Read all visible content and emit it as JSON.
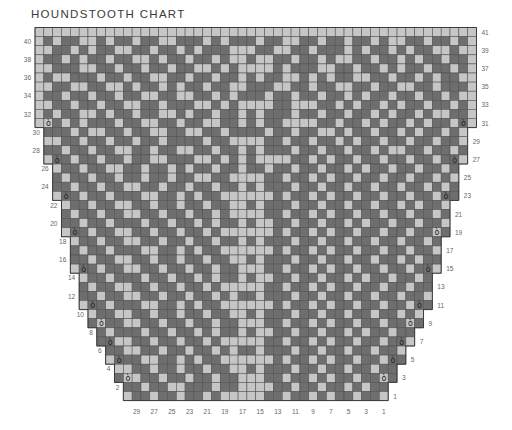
{
  "title": "HOUNDSTOOTH CHART",
  "chart_data": {
    "type": "heatmap",
    "title": "HOUNDSTOOTH CHART",
    "columns": 50,
    "rows": 41,
    "colors": {
      "light": "#c6c6c6",
      "dark": "#6e6e6e",
      "grid": "#4f4f4f",
      "marker": "#222222"
    },
    "marker_symbol": "ò",
    "marker_rows": [
      3,
      5,
      7,
      9,
      11,
      15,
      19,
      23,
      27,
      31
    ],
    "row_offsets": {
      "1": 10,
      "2": 10,
      "3": 9,
      "4": 9,
      "5": 8,
      "6": 8,
      "7": 7,
      "8": 7,
      "9": 6,
      "10": 6,
      "11": 5,
      "12": 5,
      "13": 5,
      "14": 5,
      "15": 4,
      "16": 4,
      "17": 4,
      "18": 4,
      "19": 3,
      "20": 3,
      "21": 3,
      "22": 3,
      "23": 2,
      "24": 2,
      "25": 2,
      "26": 2,
      "27": 1,
      "28": 1,
      "29": 1,
      "30": 1,
      "31": 0,
      "32": 0,
      "33": 0,
      "34": 0,
      "35": 0,
      "36": 0,
      "37": 0,
      "38": 0,
      "39": 0,
      "40": 0,
      "41": 0
    },
    "left_row_labels": [
      "40",
      "38",
      "36",
      "34",
      "32",
      "30",
      "28",
      "26",
      "24",
      "22",
      "20",
      "18",
      "16",
      "14",
      "12",
      "10",
      "8",
      "6",
      "4",
      "2"
    ],
    "right_row_labels": [
      "41",
      "39",
      "37",
      "35",
      "33",
      "31",
      "29",
      "27",
      "25",
      "23",
      "21",
      "19",
      "17",
      "15",
      "13",
      "11",
      "9",
      "7",
      "5",
      "3",
      "1"
    ],
    "bottom_col_labels": [
      "29",
      "27",
      "25",
      "23",
      "21",
      "19",
      "17",
      "15",
      "13",
      "11",
      "9",
      "7",
      "5",
      "3",
      "1"
    ],
    "grid_rows_top_to_bottom": [
      "00000000000000000000000000000000000000000000000000",
      "01011001011011001110101110110011011011010011011010",
      "00110101100110110101110001100110111010110101100100",
      "01101011011001011011010010011011010011011010110110",
      "00111001101101101100101000010111001101101011011010",
      "01001110110110011011011010110010101100110110101100",
      "00110011001011010110110011100110110011011001101110",
      "01101101101100110011010111011011011010110110110100",
      "00110110110011011100101000011000110101101011011010",
      "01011001011011001011011010111011011011010110100110",
      "00101011101100110110011010110000110110101101011010",
      "01110100110110011001101111011011001011011010110100",
      "00011011011011011110110000110110110101101101101100",
      "01101101100110110011011010111011011011010011011010",
      "00110110110110011100101010000110101101101101101100",
      "01011011001101101011011011011011011010110110110100",
      "00101101101101101100110000110110101101101101101010",
      "01110110110011011011011010111011011011011011010110",
      "00011011011100110101100000010110101101101101101100",
      "01101101100110110110110010111011011011011010110100",
      "00110110110011011011010000110110101101101101101100",
      "01011011011101101101011010011011011010110110110010",
      "00101101100110110110100000010110101101101101101100",
      "01110110110011011011011010111011011011011011010110",
      "00011011011100110101100000010110101101101101101100",
      "01101101100110110110110010111011011011011010110100",
      "00110110110011011011011000110110101101101101101100",
      "01011011011101101101011010011011011010110110110010",
      "00101101100110110110100000110110101101101101101100",
      "01110110110011011011010110111011011011011011010110",
      "00011011011100110101100000010110101101101101101100",
      "01101101100110110110110010111011011011011010110100",
      "00110110110011011011011000110110101101101101101100",
      "01011011011101101101011010011011011010110110110010",
      "00101101100110110110100000110110101101101101101100",
      "01110110110011011011010110111011011011011011010110",
      "00011011011100110101100000010110101101101101101100",
      "01101101100110110110110010111011011011011010110100",
      "00110110110011011011011000110110101101101101101100",
      "00011011011101100111011000011011011010110110110000",
      "00010010110110110110100000110110101101101011000000"
    ]
  }
}
